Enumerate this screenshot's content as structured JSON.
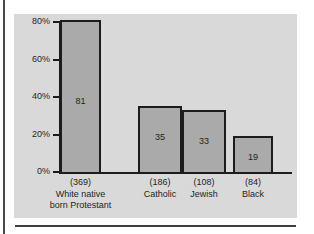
{
  "chart_data": {
    "type": "bar",
    "title": "",
    "subtitle": "",
    "xlabel": "",
    "ylabel": "",
    "ylim": [
      0,
      85
    ],
    "grid": false,
    "legend": "none",
    "ytick_labels": [
      "0%",
      "20%",
      "40%",
      "60%",
      "80%"
    ],
    "ytick_values": [
      0,
      20,
      40,
      60,
      80
    ],
    "categories": [
      "White native\nborn Protestant",
      "Catholic",
      "Jewish",
      "Black"
    ],
    "category_counts": [
      "(369)",
      "(186)",
      "(108)",
      "(84)"
    ],
    "values": [
      81,
      35,
      33,
      19
    ],
    "value_labels": [
      "81",
      "35",
      "33",
      "19"
    ],
    "bar_fill_color": "#aaaaaa",
    "bar_edge_color": "#1c1c1c",
    "panel_color": "#d9d9d9",
    "axis_color": "#1c1c1c"
  },
  "figure": {
    "panel_background": "#d9d9d9",
    "page_background": "#ffffff"
  }
}
